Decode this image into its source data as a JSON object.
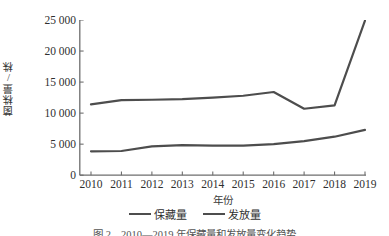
{
  "chart_data": {
    "type": "line",
    "title": "",
    "xlabel": "年份",
    "ylabel": "菌株量/株",
    "categories": [
      "2010",
      "2011",
      "2012",
      "2013",
      "2014",
      "2015",
      "2016",
      "2017",
      "2018",
      "2019"
    ],
    "xtick_labels": [
      "2010",
      "2011",
      "2012",
      "2013",
      "2014",
      "2015",
      "2016",
      "2017",
      "2018",
      "2019"
    ],
    "ytick_labels": [
      "0",
      "5 000",
      "10 000",
      "15 000",
      "20 000",
      "25 000"
    ],
    "ytick_values": [
      0,
      5000,
      10000,
      15000,
      20000,
      25000
    ],
    "ylim": [
      0,
      25000
    ],
    "grid": false,
    "legend_position": "bottom-center",
    "series": [
      {
        "name": "保藏量",
        "color": "#4d4d4d",
        "values": [
          11400,
          12100,
          12150,
          12250,
          12500,
          12800,
          13400,
          10700,
          11250,
          24900
        ]
      },
      {
        "name": "发放量",
        "color": "#4d4d4d",
        "values": [
          3850,
          3900,
          4650,
          4850,
          4780,
          4750,
          5000,
          5500,
          6200,
          7300
        ]
      }
    ]
  },
  "legend": {
    "items": [
      {
        "label": "保藏量"
      },
      {
        "label": "发放量"
      }
    ]
  },
  "caption": {
    "text": "图 2　2010—2019 年保藏量和发放量变化趋势"
  },
  "colors": {
    "line": "#4d4d4d",
    "axis": "#6e6e6e",
    "text": "#2f2f2f"
  }
}
